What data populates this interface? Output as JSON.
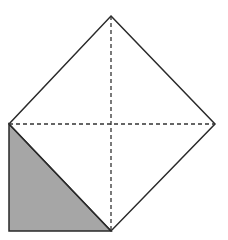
{
  "diagram": {
    "colors": {
      "background": "#ffffff",
      "stroke": "#2a2a2a",
      "shade": "#a6a6a6",
      "dash": "#333333"
    },
    "diamond": {
      "top": [
        111,
        16
      ],
      "right": [
        215,
        124
      ],
      "bottom": [
        111,
        231
      ],
      "left": [
        9,
        124
      ]
    },
    "diagonals": [
      {
        "from": [
          9,
          124
        ],
        "to": [
          215,
          124
        ],
        "style": "dashed"
      },
      {
        "from": [
          111,
          16
        ],
        "to": [
          111,
          231
        ],
        "style": "dashed"
      }
    ],
    "shaded_triangle": {
      "points": [
        [
          9,
          124
        ],
        [
          9,
          231
        ],
        [
          111,
          231
        ]
      ]
    }
  }
}
